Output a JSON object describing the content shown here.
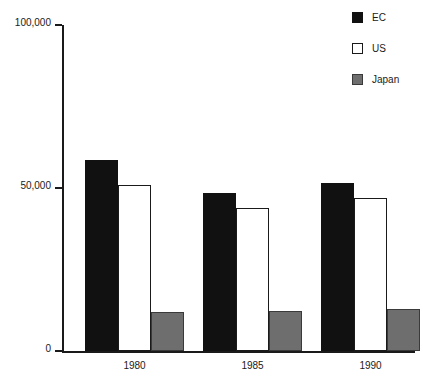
{
  "chart_data": {
    "type": "bar",
    "title": "",
    "xlabel": "",
    "ylabel": "",
    "categories": [
      "1980",
      "1985",
      "1990"
    ],
    "ylim": [
      0,
      100000
    ],
    "yticks": [
      0,
      50000,
      100000
    ],
    "ytick_labels": [
      "0",
      "50,000",
      "100,000"
    ],
    "grid": false,
    "legend_position": "top-right",
    "series": [
      {
        "name": "EC",
        "color": "#111111",
        "values": [
          58500,
          48500,
          51500
        ]
      },
      {
        "name": "US",
        "color": "#ffffff",
        "values": [
          51000,
          44000,
          47000
        ]
      },
      {
        "name": "Japan",
        "color": "#6e6e6e",
        "values": [
          12000,
          12300,
          12800
        ]
      }
    ]
  },
  "legend": {
    "items": [
      {
        "label": "EC",
        "swatch": "filled-black-square-icon"
      },
      {
        "label": "US",
        "swatch": "outlined-white-square-icon"
      },
      {
        "label": "Japan",
        "swatch": "filled-gray-square-icon"
      }
    ]
  },
  "axes": {
    "y_tick_labels": [
      "100,000",
      "50,000",
      "0"
    ],
    "x_tick_labels": [
      "1980",
      "1985",
      "1990"
    ]
  }
}
